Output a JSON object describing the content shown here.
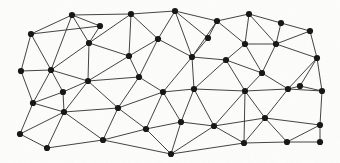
{
  "figure": {
    "kind": "triangulated-mesh-graph",
    "background_color": "#fdfdfb",
    "edge_color": "#2b2b2b",
    "vertex_color": "#141414",
    "edge_width": 0.9,
    "vertex_radius": 3.1,
    "width": 340,
    "height": 163,
    "vertex_count": 45,
    "edge_count": 108
  },
  "graph_data": {
    "type": "graph",
    "directed": false,
    "weighted": false,
    "layout": "planar-triangulation",
    "nodes": [
      {
        "id": 0,
        "x": 31,
        "y": 34
      },
      {
        "id": 1,
        "x": 72,
        "y": 15
      },
      {
        "id": 2,
        "x": 131,
        "y": 14
      },
      {
        "id": 3,
        "x": 175,
        "y": 11
      },
      {
        "id": 4,
        "x": 217,
        "y": 21
      },
      {
        "id": 5,
        "x": 249,
        "y": 14
      },
      {
        "id": 6,
        "x": 281,
        "y": 23
      },
      {
        "id": 7,
        "x": 310,
        "y": 31
      },
      {
        "id": 8,
        "x": 21,
        "y": 71
      },
      {
        "id": 9,
        "x": 51,
        "y": 70
      },
      {
        "id": 10,
        "x": 89,
        "y": 43
      },
      {
        "id": 11,
        "x": 129,
        "y": 56
      },
      {
        "id": 12,
        "x": 158,
        "y": 39
      },
      {
        "id": 13,
        "x": 192,
        "y": 57
      },
      {
        "id": 14,
        "x": 226,
        "y": 60
      },
      {
        "id": 15,
        "x": 245,
        "y": 44
      },
      {
        "id": 16,
        "x": 276,
        "y": 44
      },
      {
        "id": 17,
        "x": 317,
        "y": 58
      },
      {
        "id": 18,
        "x": 33,
        "y": 103
      },
      {
        "id": 19,
        "x": 64,
        "y": 112
      },
      {
        "id": 20,
        "x": 88,
        "y": 81
      },
      {
        "id": 21,
        "x": 118,
        "y": 108
      },
      {
        "id": 22,
        "x": 163,
        "y": 92
      },
      {
        "id": 23,
        "x": 194,
        "y": 89
      },
      {
        "id": 24,
        "x": 245,
        "y": 91
      },
      {
        "id": 25,
        "x": 288,
        "y": 89
      },
      {
        "id": 26,
        "x": 322,
        "y": 91
      },
      {
        "id": 27,
        "x": 20,
        "y": 134
      },
      {
        "id": 28,
        "x": 47,
        "y": 148
      },
      {
        "id": 29,
        "x": 103,
        "y": 140
      },
      {
        "id": 30,
        "x": 146,
        "y": 129
      },
      {
        "id": 31,
        "x": 181,
        "y": 122
      },
      {
        "id": 32,
        "x": 214,
        "y": 126
      },
      {
        "id": 33,
        "x": 265,
        "y": 118
      },
      {
        "id": 34,
        "x": 320,
        "y": 125
      },
      {
        "id": 35,
        "x": 171,
        "y": 154
      },
      {
        "id": 36,
        "x": 244,
        "y": 143
      },
      {
        "id": 37,
        "x": 287,
        "y": 142
      },
      {
        "id": 38,
        "x": 320,
        "y": 142
      },
      {
        "id": 39,
        "x": 300,
        "y": 86
      },
      {
        "id": 40,
        "x": 100,
        "y": 26
      },
      {
        "id": 41,
        "x": 63,
        "y": 92
      },
      {
        "id": 42,
        "x": 208,
        "y": 38
      },
      {
        "id": 43,
        "x": 262,
        "y": 73
      },
      {
        "id": 44,
        "x": 139,
        "y": 77
      }
    ],
    "edges": [
      [
        0,
        1
      ],
      [
        0,
        8
      ],
      [
        0,
        9
      ],
      [
        0,
        40
      ],
      [
        1,
        40
      ],
      [
        1,
        10
      ],
      [
        1,
        2
      ],
      [
        1,
        9
      ],
      [
        2,
        3
      ],
      [
        2,
        11
      ],
      [
        2,
        12
      ],
      [
        2,
        10
      ],
      [
        3,
        12
      ],
      [
        3,
        13
      ],
      [
        3,
        42
      ],
      [
        3,
        4
      ],
      [
        4,
        42
      ],
      [
        4,
        15
      ],
      [
        4,
        5
      ],
      [
        4,
        13
      ],
      [
        5,
        15
      ],
      [
        5,
        6
      ],
      [
        5,
        16
      ],
      [
        6,
        16
      ],
      [
        6,
        7
      ],
      [
        7,
        17
      ],
      [
        7,
        16
      ],
      [
        8,
        9
      ],
      [
        8,
        18
      ],
      [
        9,
        10
      ],
      [
        9,
        20
      ],
      [
        9,
        41
      ],
      [
        9,
        18
      ],
      [
        10,
        11
      ],
      [
        10,
        20
      ],
      [
        11,
        44
      ],
      [
        11,
        20
      ],
      [
        11,
        12
      ],
      [
        12,
        13
      ],
      [
        12,
        44
      ],
      [
        13,
        22
      ],
      [
        13,
        23
      ],
      [
        13,
        42
      ],
      [
        13,
        14
      ],
      [
        14,
        15
      ],
      [
        14,
        24
      ],
      [
        14,
        23
      ],
      [
        14,
        43
      ],
      [
        15,
        16
      ],
      [
        15,
        43
      ],
      [
        16,
        17
      ],
      [
        16,
        43
      ],
      [
        17,
        26
      ],
      [
        17,
        39
      ],
      [
        17,
        25
      ],
      [
        18,
        19
      ],
      [
        18,
        27
      ],
      [
        18,
        41
      ],
      [
        19,
        41
      ],
      [
        19,
        20
      ],
      [
        19,
        21
      ],
      [
        19,
        27
      ],
      [
        19,
        28
      ],
      [
        19,
        29
      ],
      [
        20,
        21
      ],
      [
        20,
        44
      ],
      [
        20,
        41
      ],
      [
        21,
        22
      ],
      [
        21,
        29
      ],
      [
        21,
        30
      ],
      [
        21,
        44
      ],
      [
        22,
        23
      ],
      [
        22,
        30
      ],
      [
        22,
        31
      ],
      [
        22,
        44
      ],
      [
        23,
        24
      ],
      [
        23,
        31
      ],
      [
        23,
        32
      ],
      [
        24,
        25
      ],
      [
        24,
        32
      ],
      [
        24,
        33
      ],
      [
        24,
        43
      ],
      [
        24,
        36
      ],
      [
        25,
        26
      ],
      [
        25,
        33
      ],
      [
        25,
        39
      ],
      [
        25,
        43
      ],
      [
        26,
        34
      ],
      [
        26,
        39
      ],
      [
        27,
        28
      ],
      [
        28,
        29
      ],
      [
        29,
        30
      ],
      [
        29,
        35
      ],
      [
        30,
        31
      ],
      [
        30,
        35
      ],
      [
        31,
        32
      ],
      [
        31,
        35
      ],
      [
        32,
        33
      ],
      [
        32,
        36
      ],
      [
        32,
        35
      ],
      [
        33,
        34
      ],
      [
        33,
        37
      ],
      [
        33,
        36
      ],
      [
        34,
        38
      ],
      [
        34,
        37
      ],
      [
        35,
        36
      ],
      [
        36,
        37
      ],
      [
        37,
        38
      ],
      [
        39,
        25
      ],
      [
        39,
        26
      ],
      [
        40,
        10
      ],
      [
        41,
        18
      ]
    ]
  }
}
